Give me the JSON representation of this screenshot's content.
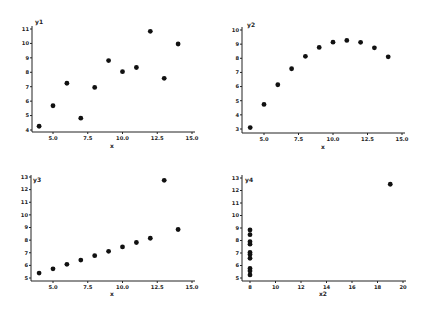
{
  "chart_data": [
    {
      "type": "scatter",
      "title": "",
      "xlabel": "x",
      "ylabel": "y1",
      "xlim": [
        3.5,
        15.2
      ],
      "ylim": [
        3.9,
        11.2
      ],
      "xticks": [
        5.0,
        7.5,
        10.0,
        12.5,
        15.0
      ],
      "xtick_labels": [
        "5.0",
        "7.5",
        "10.0",
        "12.5",
        "15.0"
      ],
      "yticks": [
        4,
        5,
        6,
        7,
        8,
        9,
        10,
        11
      ],
      "ytick_labels": [
        "4",
        "5",
        "6",
        "7",
        "8",
        "9",
        "10",
        "11"
      ],
      "grid": false,
      "x": [
        10,
        8,
        13,
        9,
        11,
        14,
        6,
        4,
        12,
        7,
        5
      ],
      "y": [
        8.04,
        6.95,
        7.58,
        8.81,
        8.33,
        9.96,
        7.24,
        4.26,
        10.84,
        4.82,
        5.68
      ]
    },
    {
      "type": "scatter",
      "title": "",
      "xlabel": "x",
      "ylabel": "y2",
      "xlim": [
        3.5,
        15.2
      ],
      "ylim": [
        2.8,
        10.1
      ],
      "xticks": [
        5.0,
        7.5,
        10.0,
        12.5,
        15.0
      ],
      "xtick_labels": [
        "5.0",
        "7.5",
        "10.0",
        "12.5",
        "15.0"
      ],
      "yticks": [
        3,
        4,
        5,
        6,
        7,
        8,
        9,
        10
      ],
      "ytick_labels": [
        "3",
        "4",
        "5",
        "6",
        "7",
        "8",
        "9",
        "10"
      ],
      "grid": false,
      "x": [
        10,
        8,
        13,
        9,
        11,
        14,
        6,
        4,
        12,
        7,
        5
      ],
      "y": [
        9.14,
        8.14,
        8.74,
        8.77,
        9.26,
        8.1,
        6.13,
        3.1,
        9.13,
        7.26,
        4.74
      ]
    },
    {
      "type": "scatter",
      "title": "",
      "xlabel": "x",
      "ylabel": "y3",
      "xlim": [
        3.5,
        15.2
      ],
      "ylim": [
        4.85,
        13.1
      ],
      "xticks": [
        5.0,
        7.5,
        10.0,
        12.5,
        15.0
      ],
      "xtick_labels": [
        "5.0",
        "7.5",
        "10.0",
        "12.5",
        "15.0"
      ],
      "yticks": [
        5,
        6,
        7,
        8,
        9,
        10,
        11,
        12,
        13
      ],
      "ytick_labels": [
        "5",
        "6",
        "7",
        "8",
        "9",
        "10",
        "11",
        "12",
        "13"
      ],
      "grid": false,
      "x": [
        10,
        8,
        13,
        9,
        11,
        14,
        6,
        4,
        12,
        7,
        5
      ],
      "y": [
        7.46,
        6.77,
        12.74,
        7.11,
        7.81,
        8.84,
        6.08,
        5.39,
        8.15,
        6.42,
        5.73
      ]
    },
    {
      "type": "scatter",
      "title": "",
      "xlabel": "x2",
      "ylabel": "y4",
      "xlim": [
        7.4,
        20.2
      ],
      "ylim": [
        4.85,
        13.1
      ],
      "xticks": [
        8,
        10,
        12,
        14,
        16,
        18,
        20
      ],
      "xtick_labels": [
        "8",
        "10",
        "12",
        "14",
        "16",
        "18",
        "20"
      ],
      "yticks": [
        5,
        6,
        7,
        8,
        9,
        10,
        11,
        12,
        13
      ],
      "ytick_labels": [
        "5",
        "6",
        "7",
        "8",
        "9",
        "10",
        "11",
        "12",
        "13"
      ],
      "grid": false,
      "x": [
        8,
        8,
        8,
        8,
        8,
        8,
        8,
        19,
        8,
        8,
        8
      ],
      "y": [
        6.58,
        5.76,
        7.71,
        8.84,
        8.47,
        7.04,
        5.25,
        12.5,
        5.56,
        7.91,
        6.89
      ]
    }
  ],
  "panels": [
    {
      "xlabel": "x",
      "ylabel": "y1"
    },
    {
      "xlabel": "x",
      "ylabel": "y2"
    },
    {
      "xlabel": "x",
      "ylabel": "y3"
    },
    {
      "xlabel": "x2",
      "ylabel": "y4"
    }
  ]
}
